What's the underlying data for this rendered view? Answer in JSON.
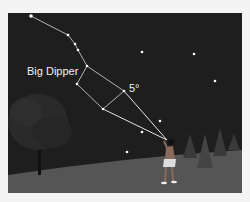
{
  "figure": {
    "constellation_label": "Big Dipper",
    "angle_label": "5°",
    "colors": {
      "sky": "#1e1e1e",
      "ground": "#5a5a5a",
      "star": "#ffffff",
      "lines": "#d8d8d8",
      "background": "#f4f4f4"
    },
    "big_dipper_stars": [
      {
        "name": "handle-end",
        "x": 31,
        "y": 16
      },
      {
        "name": "handle-2",
        "x": 68,
        "y": 35
      },
      {
        "name": "handle-3",
        "x": 75,
        "y": 44
      },
      {
        "name": "handle-4",
        "x": 78,
        "y": 50
      },
      {
        "name": "bowl-top-left",
        "x": 87,
        "y": 66
      },
      {
        "name": "bowl-bottom-left",
        "x": 77,
        "y": 84
      },
      {
        "name": "bowl-bottom-right",
        "x": 103,
        "y": 109
      },
      {
        "name": "bowl-top-right",
        "x": 124,
        "y": 91
      }
    ],
    "other_stars": [
      {
        "x": 142,
        "y": 52
      },
      {
        "x": 194,
        "y": 54
      },
      {
        "x": 215,
        "y": 81
      },
      {
        "x": 160,
        "y": 121
      },
      {
        "x": 142,
        "y": 132
      },
      {
        "x": 127,
        "y": 152
      }
    ],
    "observer_eye": {
      "x": 167,
      "y": 140
    }
  }
}
